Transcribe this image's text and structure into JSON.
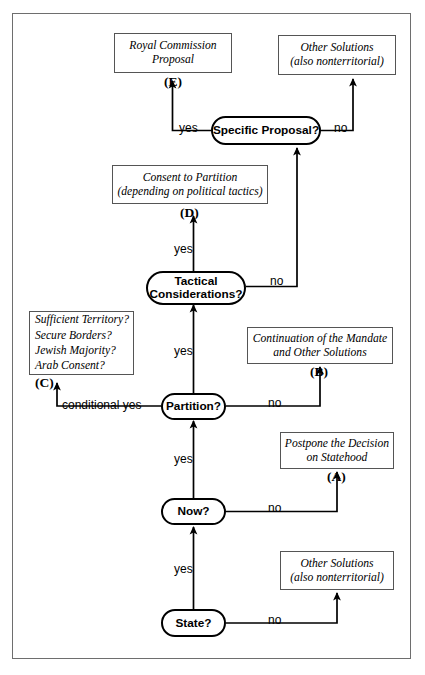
{
  "diagram": {
    "colors": {
      "frame_border": "#6e6e6e",
      "box_border": "#555555",
      "pill_border": "#000000",
      "edge": "#000000",
      "background": "#ffffff"
    },
    "nodes": {
      "state": {
        "label": "State?"
      },
      "now": {
        "label": "Now?"
      },
      "partition": {
        "label": "Partition?"
      },
      "tactical": {
        "line1": "Tactical",
        "line2": "Considerations?"
      },
      "specific": {
        "label": "Specific Proposal?"
      }
    },
    "outcomes": {
      "royal_commission": {
        "line1": "Royal Commission",
        "line2": "Proposal",
        "tag": "(E)"
      },
      "other_solutions_top": {
        "line1": "Other Solutions",
        "line2": "(also nonterritorial)"
      },
      "consent_partition": {
        "line1": "Consent to Partition",
        "line2": "(depending on political tactics)",
        "tag": "(D)"
      },
      "conditions": {
        "line1": "Sufficient Territory?",
        "line2": "Secure Borders?",
        "line3": "Jewish Majority?",
        "line4": "Arab Consent?",
        "tag": "(C)"
      },
      "continuation_mandate": {
        "line1": "Continuation of the Mandate",
        "line2": "and Other Solutions",
        "tag": "(B)"
      },
      "postpone_decision": {
        "line1": "Postpone the Decision",
        "line2": "on Statehood",
        "tag": "(A)"
      },
      "other_solutions_bottom": {
        "line1": "Other Solutions",
        "line2": "(also nonterritorial)"
      }
    },
    "edges": {
      "state_yes": "yes",
      "state_no": "no",
      "now_yes": "yes",
      "now_no": "no",
      "partition_conditional_yes": "conditional yes",
      "partition_yes": "yes",
      "partition_no": "no",
      "tactical_yes": "yes",
      "tactical_no": "no",
      "specific_yes": "yes",
      "specific_no": "no"
    }
  }
}
